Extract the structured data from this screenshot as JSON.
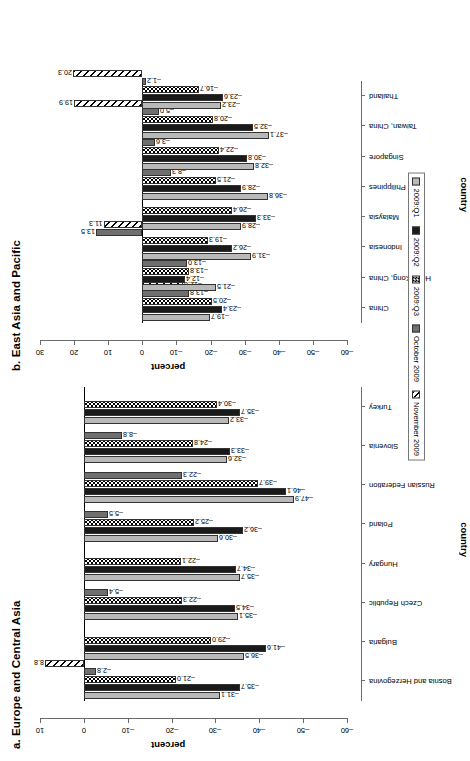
{
  "figure": {
    "panel_a_title": "a. Europe and Central Asia",
    "panel_b_title": "b. East Asia and Pacific",
    "xaxis_title": "country",
    "yaxis_title": "percent"
  },
  "legend": {
    "items": [
      {
        "label": "2009:Q1",
        "swatch": "light-gray-solid",
        "color": "#b9b9b9"
      },
      {
        "label": "2009:Q2",
        "swatch": "black-solid",
        "color": "#1a1a1a"
      },
      {
        "label": "2009:Q3",
        "swatch": "checkered",
        "color": "#000000"
      },
      {
        "label": "October 2009",
        "swatch": "dark-gray-solid",
        "color": "#6f6f6f"
      },
      {
        "label": "November 2009",
        "swatch": "diagonal-hatch",
        "color": "#000000"
      }
    ]
  },
  "chart_data": [
    {
      "type": "bar",
      "title": "a. Europe and Central Asia",
      "xlabel": "country",
      "ylabel": "percent",
      "ylim": [
        -60,
        10
      ],
      "yticks": [
        -60,
        -50,
        -40,
        -30,
        -20,
        -10,
        0,
        10
      ],
      "grid": false,
      "legend_position": "bottom",
      "categories": [
        "Bosnia and Herzegovina",
        "Bulgaria",
        "Czech Republic",
        "Hungary",
        "Poland",
        "Russian Federation",
        "Slovenia",
        "Turkey"
      ],
      "series": [
        {
          "name": "2009:Q1",
          "values": [
            -31.1,
            -36.5,
            -35.1,
            -35.7,
            -30.6,
            -47.9,
            -32.6,
            -33.2
          ]
        },
        {
          "name": "2009:Q2",
          "values": [
            -35.7,
            -41.6,
            -34.5,
            -34.7,
            -36.2,
            -46.1,
            -33.3,
            -35.7
          ]
        },
        {
          "name": "2009:Q3",
          "values": [
            -21.0,
            -29.0,
            -22.3,
            -22.1,
            -25.2,
            -39.7,
            -24.8,
            -30.4
          ]
        },
        {
          "name": "October 2009",
          "values": [
            -2.8,
            null,
            -5.4,
            null,
            -5.5,
            -22.3,
            -8.8,
            null
          ]
        },
        {
          "name": "November 2009",
          "values": [
            8.8,
            null,
            null,
            null,
            null,
            null,
            null,
            null
          ]
        }
      ]
    },
    {
      "type": "bar",
      "title": "b. East Asia and Pacific",
      "xlabel": "country",
      "ylabel": "percent",
      "ylim": [
        -60,
        30
      ],
      "yticks": [
        -60,
        -50,
        -40,
        -30,
        -20,
        -10,
        0,
        10,
        20,
        30
      ],
      "grid": false,
      "legend_position": "bottom",
      "categories": [
        "China",
        "Hong Kong, China",
        "Indonesia",
        "Malaysia",
        "Philippines",
        "Singapore",
        "Taiwan, China",
        "Thailand"
      ],
      "series": [
        {
          "name": "2009:Q1",
          "values": [
            -19.7,
            -21.5,
            -31.9,
            -28.9,
            -36.8,
            -32.8,
            -37.1,
            -23.2
          ]
        },
        {
          "name": "2009:Q2",
          "values": [
            -23.4,
            -12.4,
            -26.2,
            -33.3,
            -28.9,
            -30.8,
            -32.5,
            -23.6
          ]
        },
        {
          "name": "2009:Q3",
          "values": [
            -20.5,
            -13.8,
            -19.3,
            -26.4,
            -21.5,
            -22.4,
            -20.8,
            -16.7
          ]
        },
        {
          "name": "October 2009",
          "values": [
            -13.8,
            -13.0,
            13.5,
            null,
            -8.3,
            -3.6,
            -5.0,
            -1.2
          ]
        },
        {
          "name": "November 2009",
          "values": [
            -12.0,
            null,
            11.3,
            null,
            null,
            null,
            19.9,
            20.3
          ]
        }
      ]
    }
  ]
}
